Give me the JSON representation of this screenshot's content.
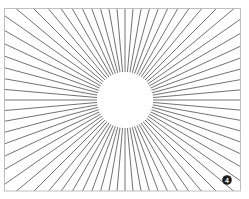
{
  "figure": {
    "background_color": "#ffffff",
    "frame": {
      "x": 4.5,
      "y": 8.5,
      "width": 236,
      "height": 182.5,
      "stroke_color": "#b9b9b9",
      "stroke_width": 0.9
    },
    "rays": {
      "count": 72,
      "center_x": 125,
      "center_y": 100,
      "inner_radius": 28,
      "outer_radius": 330,
      "start_angle_deg": 0,
      "stroke_color": "#3a3a3a",
      "stroke_width": 0.72
    },
    "center_disc": {
      "cx": 125,
      "cy": 100,
      "r": 28,
      "fill": "#ffffff"
    },
    "badge": {
      "label": "4",
      "cx": 227,
      "cy": 180,
      "r": 4.8,
      "fill": "#1c1c1c",
      "text_color": "#ffffff"
    }
  },
  "chart_data": {
    "type": "line",
    "subtitle": "",
    "xlabel": "",
    "ylabel": "",
    "grid": false,
    "legend_position": "none",
    "series": [
      {
        "name": "rays",
        "count": 72,
        "angle_step_deg": 5,
        "angles_deg": [
          0,
          5,
          10,
          15,
          20,
          25,
          30,
          35,
          40,
          45,
          50,
          55,
          60,
          65,
          70,
          75,
          80,
          85,
          90,
          95,
          100,
          105,
          110,
          115,
          120,
          125,
          130,
          135,
          140,
          145,
          150,
          155,
          160,
          165,
          170,
          175,
          180,
          185,
          190,
          195,
          200,
          205,
          210,
          215,
          220,
          225,
          230,
          235,
          240,
          245,
          250,
          255,
          260,
          265,
          270,
          275,
          280,
          285,
          290,
          295,
          300,
          305,
          310,
          315,
          320,
          325,
          330,
          335,
          340,
          345,
          350,
          355
        ]
      }
    ],
    "annotations": [
      {
        "label": "4",
        "x": 227,
        "y": 180,
        "kind": "figure-number-badge"
      }
    ],
    "xlim": [
      4.5,
      240.5
    ],
    "ylim": [
      8.5,
      191
    ]
  }
}
